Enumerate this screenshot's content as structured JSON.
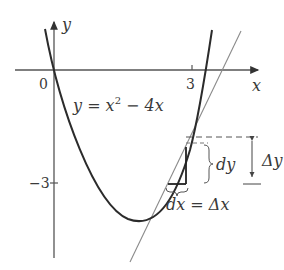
{
  "diagram": {
    "axes": {
      "x_label": "x",
      "y_label": "y",
      "origin_label": "0",
      "x_tick_label": "3",
      "y_tick_label": "−3"
    },
    "curve": {
      "equation_label": "y = x² − 4x",
      "equation_lhs": "y = x",
      "equation_exp": "2",
      "equation_rhs": " − 4x"
    },
    "annotations": {
      "dy_label": "dy",
      "delta_y_label": "Δy",
      "dx_label": "dx = Δx"
    },
    "colors": {
      "curve": "#2b2b2b",
      "axes": "#555555",
      "tangent": "#8a8a8a",
      "text": "#3a3a3a",
      "dashed": "#555555"
    }
  }
}
